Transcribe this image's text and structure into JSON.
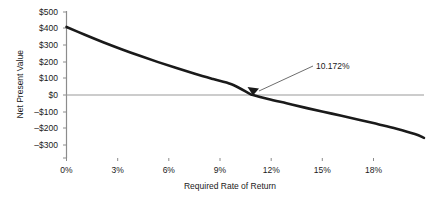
{
  "chart_data": {
    "type": "line",
    "title": "",
    "xlabel": "Required Rate of Return",
    "ylabel": "Net Present Value",
    "xlim": [
      0,
      19.5
    ],
    "ylim": [
      -300,
      500
    ],
    "xticks": [
      "0%",
      "3%",
      "6%",
      "9%",
      "12%",
      "15%",
      "18%"
    ],
    "xtick_values": [
      0,
      3,
      6,
      9,
      12,
      15,
      18
    ],
    "yticks": [
      "$500",
      "$400",
      "$300",
      "$200",
      "$100",
      "$0",
      "–$100",
      "–$200",
      "–$300"
    ],
    "ytick_values": [
      500,
      400,
      300,
      200,
      100,
      0,
      -100,
      -200,
      -300
    ],
    "grid": false,
    "legend": false,
    "zero_line": true,
    "series": [
      {
        "name": "Net Present Value",
        "x": [
          0,
          1,
          2,
          3,
          4,
          5,
          6,
          7,
          8,
          9,
          10,
          10.172,
          11,
          12,
          13,
          14,
          15,
          16,
          17,
          18,
          19,
          19.5
        ],
        "values": [
          410,
          363,
          318,
          276,
          236,
          198,
          162,
          128,
          96,
          65,
          7,
          0,
          -24,
          -50,
          -76,
          -101,
          -125,
          -150,
          -176,
          -203,
          -235,
          -258
        ]
      }
    ],
    "annotations": [
      {
        "name": "irr-label",
        "text": "10.172%",
        "point_x": 10.172,
        "point_y": 0,
        "marker": "triangle"
      }
    ],
    "colors": {
      "curve": "#1a1a1a",
      "axis": "#8c8c8c",
      "zero_line": "#8c8c8c",
      "text": "#1a1a1a",
      "leader_line": "#6e6e6e",
      "background": "#ffffff"
    }
  }
}
